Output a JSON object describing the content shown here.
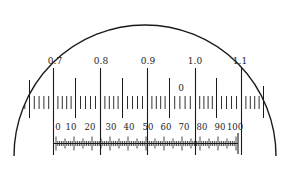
{
  "diagram": {
    "type": "reticle-scale",
    "colors": {
      "line": "#1a1a1a",
      "background": "#ffffff"
    },
    "upper_scale": {
      "major_labels": [
        "0.7",
        "0.8",
        "0.9",
        "1.0",
        "1.1"
      ],
      "zero_marker": "0"
    },
    "lower_scale": {
      "labels": [
        "0",
        "10",
        "20",
        "30",
        "40",
        "50",
        "60",
        "70",
        "80",
        "90",
        "100"
      ]
    }
  }
}
